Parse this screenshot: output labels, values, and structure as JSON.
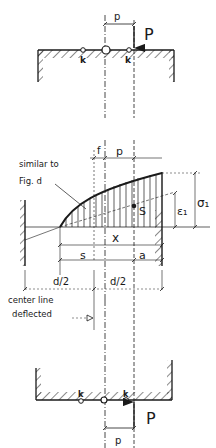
{
  "figure": {
    "type": "engineering-diagram",
    "colors": {
      "ink": "#1a1a1a",
      "background": "#ffffff"
    }
  },
  "top_view": {
    "load_label": "P",
    "eccentricity_label": "p",
    "point_labels": [
      "k",
      "k"
    ]
  },
  "middle_view": {
    "note_line1": "similar to",
    "note_line2": "Fig. d",
    "dim_f": "f",
    "dim_p": "p",
    "point_S": "S",
    "dim_x": "x",
    "dim_s": "s",
    "dim_a": "a",
    "dim_epsilon": "ε₁",
    "dim_sigma": "σ₁",
    "half_left": "d/2",
    "half_right": "d/2",
    "center_note_line1": "center line",
    "center_note_line2": "deflected"
  },
  "bottom_view": {
    "load_label": "P",
    "eccentricity_label": "p",
    "point_labels": [
      "k",
      "k"
    ]
  }
}
